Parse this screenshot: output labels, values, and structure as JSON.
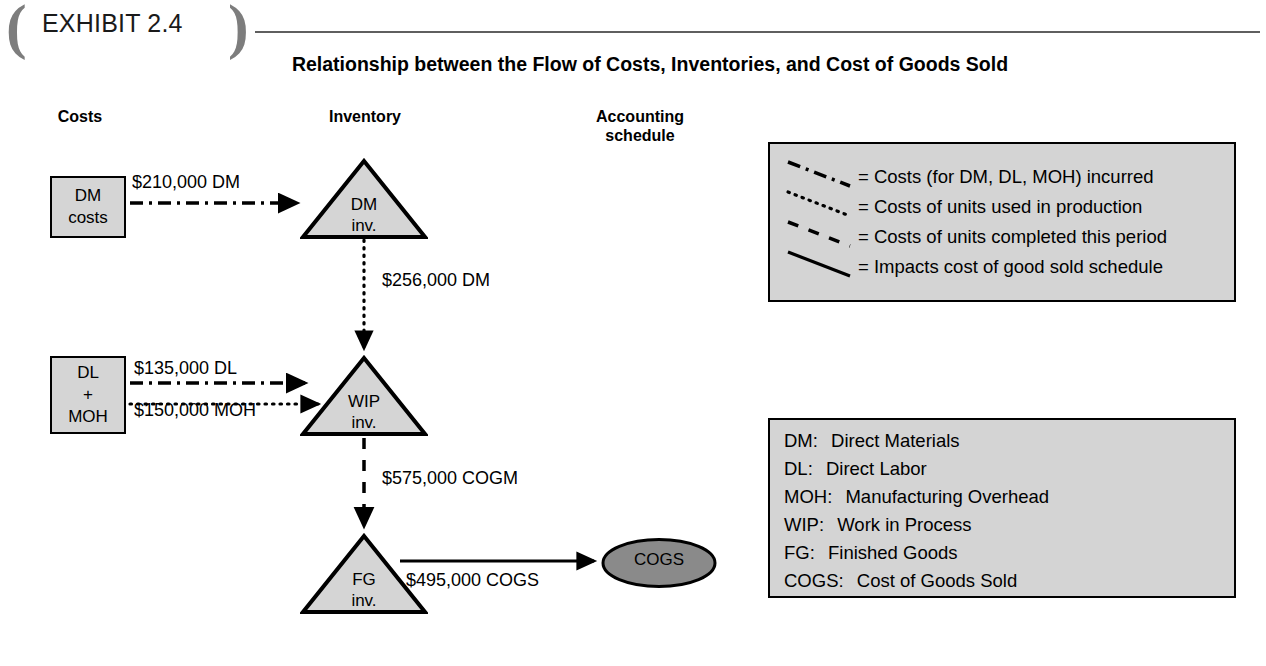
{
  "exhibit": {
    "bracket_left": "(",
    "bracket_right": ")",
    "label": "EXHIBIT 2.4"
  },
  "title": "Relationship between the Flow of Costs, Inventories, and Cost of Goods Sold",
  "column_headers": {
    "costs": "Costs",
    "inventory": "Inventory",
    "accounting": "Accounting\nschedule"
  },
  "nodes": {
    "dm_costs_line1": "DM",
    "dm_costs_line2": "costs",
    "dl_moh_line1": "DL",
    "dl_moh_line2": "+",
    "dl_moh_line3": "MOH",
    "dm_inv_line1": "DM",
    "dm_inv_line2": "inv.",
    "wip_inv_line1": "WIP",
    "wip_inv_line2": "inv.",
    "fg_inv_line1": "FG",
    "fg_inv_line2": "inv.",
    "cogs": "COGS"
  },
  "flows": {
    "dm_incurred": "$210,000 DM",
    "dm_used": "$256,000 DM",
    "dl_incurred": "$135,000 DL",
    "moh_incurred": "$150,000 MOH",
    "cogm": "$575,000 COGM",
    "cogs": "$495,000 COGS"
  },
  "legend": {
    "items": [
      {
        "style": "dash-dot",
        "text": "= Costs (for DM, DL, MOH) incurred"
      },
      {
        "style": "dotted",
        "text": "= Costs of units used in production"
      },
      {
        "style": "dashed",
        "text": "= Costs of units completed this period"
      },
      {
        "style": "solid",
        "text": "= Impacts cost of good sold schedule"
      }
    ]
  },
  "abbreviations": {
    "items": [
      {
        "key": "DM:",
        "value": "Direct Materials"
      },
      {
        "key": "DL:",
        "value": "Direct Labor"
      },
      {
        "key": "MOH:",
        "value": "Manufacturing Overhead"
      },
      {
        "key": "WIP:",
        "value": "Work in Process"
      },
      {
        "key": "FG:",
        "value": "Finished Goods"
      },
      {
        "key": "COGS:",
        "value": "Cost of Goods Sold"
      }
    ]
  },
  "colors": {
    "shape_fill": "#d5d5d5",
    "panel_fill": "#d4d4d4",
    "cogs_fill": "#8a8a8a",
    "stroke": "#000000",
    "bracket": "#7d7d7d"
  }
}
